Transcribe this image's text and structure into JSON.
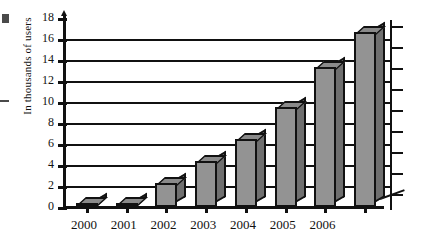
{
  "chart_data": {
    "type": "bar",
    "title": "",
    "xlabel": "",
    "ylabel": "In thousands of users",
    "categories": [
      "2000",
      "2001",
      "2002",
      "2003",
      "2004",
      "2005",
      "2006",
      ""
    ],
    "values": [
      0.4,
      0.4,
      2.3,
      4.4,
      6.5,
      9.5,
      13.3,
      16.7
    ],
    "ytick_labels": [
      "0",
      "2",
      "4",
      "6",
      "8",
      "10",
      "12",
      "14",
      "16",
      "18"
    ],
    "ytick_values": [
      0,
      2,
      4,
      6,
      8,
      10,
      12,
      14,
      16,
      18
    ],
    "ylim": [
      0,
      18
    ],
    "grid": "horizontal",
    "gridline_values": [
      2,
      4,
      6,
      8,
      10,
      12,
      14,
      16
    ],
    "legend": "none",
    "style": "3d-grayscale",
    "bar_color": "#939393",
    "bar_side_color": "#6f6f6f",
    "bar_top_color": "#8a8a8a",
    "outline_color": "#111111",
    "background_color": "#ffffff"
  },
  "axes": {
    "y_axis_title": "In thousands of users",
    "right_axis_tick_count": 9
  }
}
